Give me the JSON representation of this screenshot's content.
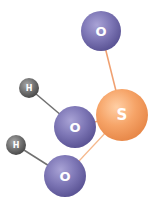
{
  "diagram": {
    "type": "molecule-ball-and-stick",
    "molecule": "H2SO3",
    "colors": {
      "oxygen": "#7b74b3",
      "sulfur": "#f5a46a",
      "hydrogen": "#6e6e6e",
      "bond_s_o": "#f0a070",
      "bond_o_h": "#707070",
      "background": "#ffffff"
    },
    "atoms": [
      {
        "id": "o1",
        "element": "O",
        "label": "O",
        "cx": 101,
        "cy": 31,
        "r": 20
      },
      {
        "id": "s",
        "element": "S",
        "label": "S",
        "cx": 122,
        "cy": 115,
        "r": 26
      },
      {
        "id": "o2",
        "element": "O",
        "label": "O",
        "cx": 75,
        "cy": 127,
        "r": 21
      },
      {
        "id": "o3",
        "element": "O",
        "label": "O",
        "cx": 65,
        "cy": 176,
        "r": 21
      },
      {
        "id": "h1",
        "element": "H",
        "label": "H",
        "cx": 29,
        "cy": 88,
        "r": 10
      },
      {
        "id": "h2",
        "element": "H",
        "label": "H",
        "cx": 16,
        "cy": 145,
        "r": 10
      }
    ],
    "bonds": [
      {
        "from": "s",
        "to": "o1"
      },
      {
        "from": "s",
        "to": "o2"
      },
      {
        "from": "s",
        "to": "o3"
      },
      {
        "from": "o2",
        "to": "h1"
      },
      {
        "from": "o3",
        "to": "h2"
      }
    ]
  }
}
